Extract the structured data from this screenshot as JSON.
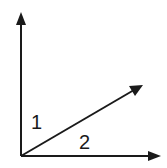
{
  "diagram": {
    "type": "angle-diagram",
    "vertex": {
      "x": 21,
      "y": 156
    },
    "rays": [
      {
        "name": "vertical-ray",
        "tip": {
          "x": 21,
          "y": 12
        }
      },
      {
        "name": "diagonal-ray",
        "tip": {
          "x": 143,
          "y": 85
        }
      },
      {
        "name": "horizontal-ray",
        "tip": {
          "x": 161,
          "y": 156
        }
      }
    ],
    "labels": {
      "angle_1": "1",
      "angle_2": "2"
    },
    "colors": {
      "stroke": "#1a1a1a",
      "background": "#ffffff"
    }
  }
}
